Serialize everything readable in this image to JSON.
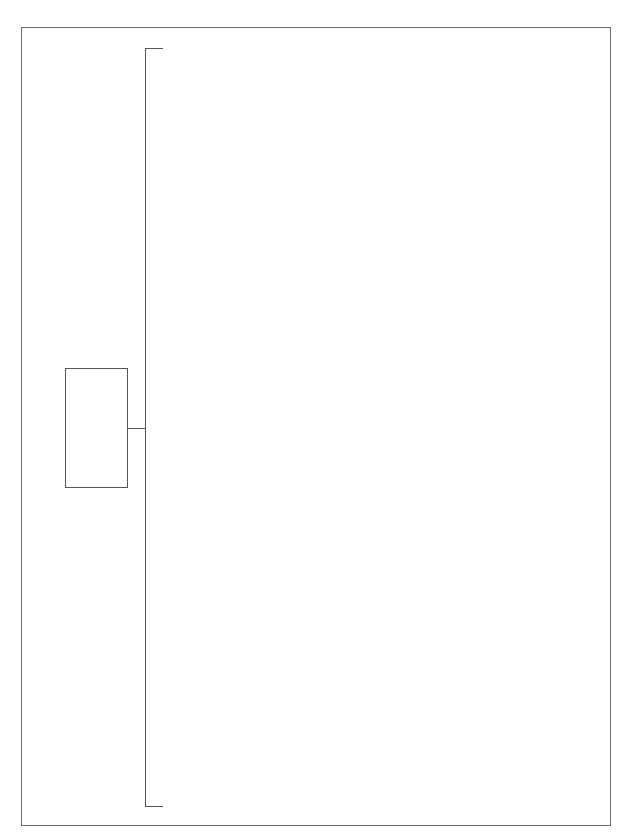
{
  "diagram": {
    "type": "tree",
    "orientation": "left-to-right",
    "colors": {
      "background": "#ffffff",
      "frame": "#6a6a6a",
      "stroke": "#555555"
    },
    "nodes": [
      {
        "id": "root",
        "label": ""
      }
    ],
    "branches": {
      "count": 2,
      "labels": [
        "",
        ""
      ]
    }
  }
}
